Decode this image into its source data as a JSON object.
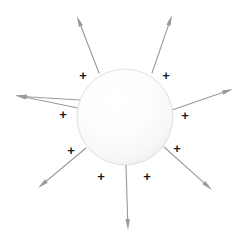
{
  "figure": {
    "background_color": "#ffffff",
    "width": 251,
    "height": 248
  },
  "sphere": {
    "name": "charged-sphere",
    "center_x": 125,
    "center_y": 117,
    "radius": 48,
    "fill_light": "#ffffff",
    "fill_mid": "#fbfbfb",
    "fill_edge": "#ececec",
    "outline_color": "#d8d8d8",
    "outline_width": 0.8,
    "highlight_x": 102,
    "highlight_y": 92
  },
  "charge_symbol": {
    "glyph": "+",
    "color": "#1a1a1a",
    "font_size": 13
  },
  "charges": [
    {
      "name": "charge-plus-top-left",
      "label": "+",
      "x": 83,
      "y": 75
    },
    {
      "name": "charge-plus-top-right",
      "label": "+",
      "x": 166,
      "y": 75
    },
    {
      "name": "charge-plus-left",
      "label": "+",
      "x": 63,
      "y": 114
    },
    {
      "name": "charge-plus-right",
      "label": "+",
      "x": 185,
      "y": 115
    },
    {
      "name": "charge-plus-lower-left",
      "label": "+",
      "x": 71,
      "y": 150
    },
    {
      "name": "charge-plus-lower-right",
      "label": "+",
      "x": 177,
      "y": 148
    },
    {
      "name": "charge-plus-bottom-left",
      "label": "+",
      "x": 101,
      "y": 176
    },
    {
      "name": "charge-plus-bottom-right",
      "label": "+",
      "x": 147,
      "y": 176
    }
  ],
  "field_lines": {
    "color": "#9a9a9a",
    "stroke_width": 1.1,
    "arrowhead_length": 11,
    "arrowhead_width": 4.4,
    "count": 8,
    "direction": "outward",
    "arrows": [
      {
        "name": "field-arrow-up-left",
        "angle_deg": 250,
        "x1": 99,
        "y1": 73,
        "x2": 77,
        "y2": 16
      },
      {
        "name": "field-arrow-up-right",
        "angle_deg": 290,
        "x1": 152,
        "y1": 73,
        "x2": 172,
        "y2": 15
      },
      {
        "name": "field-arrow-left",
        "angle_deg": 187,
        "x1": 78,
        "y1": 108,
        "x2": 15,
        "y2": 95
      },
      {
        "name": "field-arrow-right",
        "angle_deg": 352,
        "x1": 172,
        "y1": 110,
        "x2": 233,
        "y2": 89
      },
      {
        "name": "field-arrow-down-left",
        "angle_deg": 143,
        "x1": 86,
        "y1": 148,
        "x2": 38,
        "y2": 188
      },
      {
        "name": "field-arrow-down-right",
        "angle_deg": 36,
        "x1": 164,
        "y1": 147,
        "x2": 212,
        "y2": 190
      },
      {
        "name": "field-arrow-down",
        "angle_deg": 90,
        "x1": 126,
        "y1": 165,
        "x2": 128,
        "y2": 230
      },
      {
        "name": "field-arrow-upper-left-2",
        "angle_deg": 205,
        "x1": 80,
        "y1": 100,
        "x2": 16,
        "y2": 96
      }
    ]
  }
}
